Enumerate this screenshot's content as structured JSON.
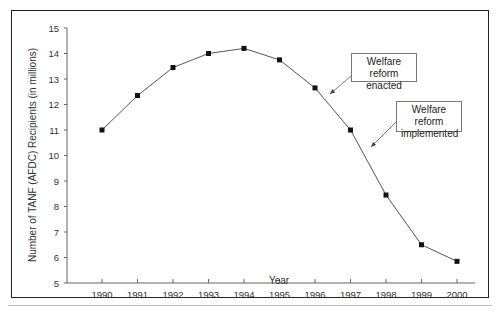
{
  "chart_data": {
    "type": "line",
    "title": "",
    "xlabel": "Year",
    "ylabel": "Number of TANF (AFDC) Recipients (in millions)",
    "x": [
      1990,
      1991,
      1992,
      1993,
      1994,
      1995,
      1996,
      1997,
      1998,
      1999,
      2000
    ],
    "series": [
      {
        "name": "TANF (AFDC) Recipients",
        "values": [
          11.0,
          12.35,
          13.45,
          14.0,
          14.2,
          13.75,
          12.65,
          11.0,
          8.45,
          6.5,
          5.85
        ],
        "marker": "square",
        "color": "#111111",
        "line_color": "#555555"
      }
    ],
    "ylim": [
      5,
      15
    ],
    "yticks": [
      5,
      6,
      7,
      8,
      9,
      10,
      11,
      12,
      13,
      14,
      15
    ],
    "xticks": [
      "1990",
      "1991",
      "1992",
      "1993",
      "1994",
      "1995",
      "1996",
      "1997",
      "1998",
      "1999",
      "2000"
    ],
    "grid": false,
    "legend": null,
    "annotations": [
      {
        "text_line1": "Welfare reform",
        "text_line2": "enacted",
        "x": 1996.5,
        "y": 11.9
      },
      {
        "text_line1": "Welfare reform",
        "text_line2": "implemented",
        "x": 1997.7,
        "y": 9.4
      }
    ]
  },
  "annotations": {
    "enacted": {
      "line1": "Welfare reform",
      "line2": "enacted"
    },
    "implemented": {
      "line1": "Welfare reform",
      "line2": "implemented"
    }
  },
  "axes": {
    "xlabel": "Year",
    "ylabel": "Number of TANF (AFDC) Recipients (in millions)"
  }
}
